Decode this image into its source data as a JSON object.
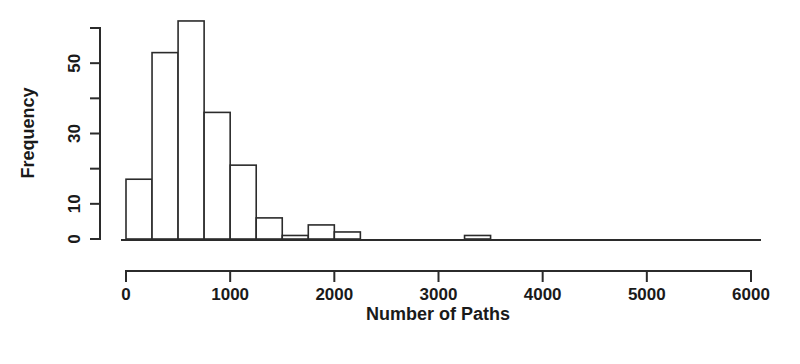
{
  "figure": {
    "background_color": "#ffffff",
    "ink_color": "#2b2b2b",
    "width": 800,
    "height": 364
  },
  "chart_data": {
    "type": "bar",
    "title": "",
    "subtitle": "",
    "xlabel": "Number of Paths",
    "ylabel": "Frequency",
    "xlim": [
      0,
      6000
    ],
    "ylim": [
      0,
      62
    ],
    "grid": false,
    "legend": null,
    "bin_width": 250,
    "bin_edges": [
      0,
      250,
      500,
      750,
      1000,
      1250,
      1500,
      1750,
      2000,
      2250,
      2500,
      2750,
      3000,
      3250,
      3500,
      3750,
      4000
    ],
    "categories": [
      "0-250",
      "250-500",
      "500-750",
      "750-1000",
      "1000-1250",
      "1250-1500",
      "1500-1750",
      "1750-2000",
      "2000-2250",
      "2250-2500",
      "2500-2750",
      "2750-3000",
      "3000-3250",
      "3250-3500",
      "3500-3750",
      "3750-4000"
    ],
    "values": [
      17,
      53,
      62,
      36,
      21,
      6,
      1,
      4,
      2,
      0,
      0,
      0,
      0,
      1,
      0,
      0
    ],
    "x_ticks": [
      0,
      1000,
      2000,
      3000,
      4000,
      5000,
      6000
    ],
    "x_tick_labels": [
      "0",
      "1000",
      "2000",
      "3000",
      "4000",
      "5000",
      "6000"
    ],
    "y_ticks": [
      0,
      10,
      20,
      30,
      40,
      50,
      60
    ],
    "y_tick_labels": [
      "0",
      "10",
      "",
      "30",
      "",
      "50",
      ""
    ],
    "y_labeled_ticks": [
      0,
      10,
      30,
      50
    ]
  },
  "axes": {
    "x_axis_name": "x-axis",
    "y_axis_name": "y-axis"
  }
}
